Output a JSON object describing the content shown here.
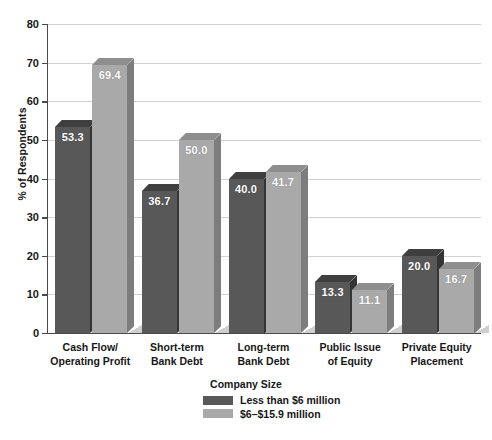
{
  "chart_data": {
    "type": "bar",
    "title": "",
    "xlabel": "",
    "ylabel": "% of Respondents",
    "ylim": [
      0,
      80
    ],
    "ytick_step": 10,
    "yticks": [
      "0",
      "10",
      "20",
      "30",
      "40",
      "50",
      "60",
      "70",
      "80"
    ],
    "grid": "horizontal",
    "legend_position": "bottom",
    "legend_title": "Company Size",
    "categories": [
      "Cash Flow/ Operating Profit",
      "Short-term Bank Debt",
      "Long-term Bank Debt",
      "Public Issue of Equity",
      "Private Equity Placement"
    ],
    "category_lines": [
      [
        "Cash Flow/",
        "Operating Profit"
      ],
      [
        "Short-term",
        "Bank Debt"
      ],
      [
        "Long-term",
        "Bank Debt"
      ],
      [
        "Public Issue",
        "of Equity"
      ],
      [
        "Private Equity",
        "Placement"
      ]
    ],
    "series": [
      {
        "name": "Less than $6 million",
        "color": "#585858",
        "values": [
          53.3,
          36.7,
          40.0,
          13.3,
          20.0
        ],
        "labels": [
          "53.3",
          "36.7",
          "40.0",
          "13.3",
          "20.0"
        ]
      },
      {
        "name": "$6–$15.9 million",
        "color": "#a9a9a9",
        "values": [
          69.4,
          50.0,
          41.7,
          11.1,
          16.7
        ],
        "labels": [
          "69.4",
          "50.0",
          "41.7",
          "11.1",
          "16.7"
        ]
      }
    ]
  },
  "axis": {
    "y_title": "% of Respondents"
  },
  "legend": {
    "title": "Company Size",
    "items": [
      {
        "label": "Less than $6 million",
        "color": "#585858"
      },
      {
        "label": "$6–$15.9 million",
        "color": "#a9a9a9"
      }
    ]
  }
}
